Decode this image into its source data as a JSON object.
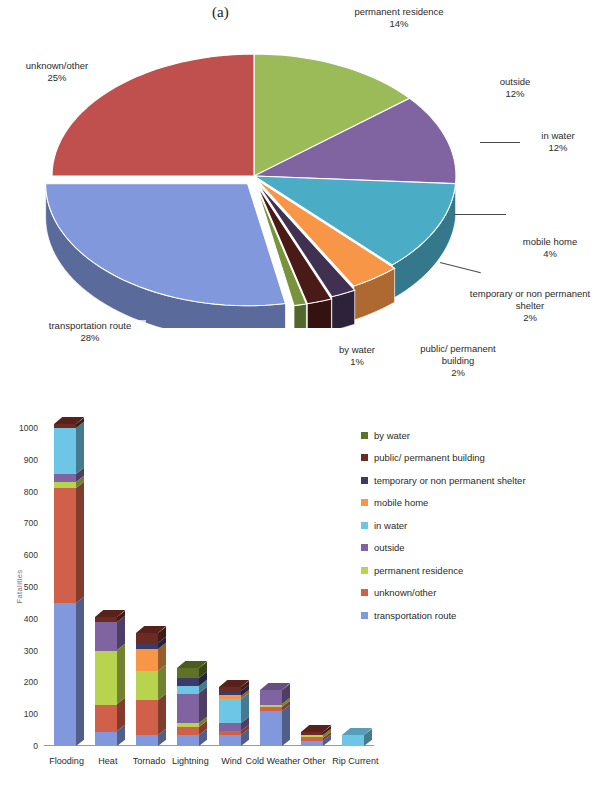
{
  "figure": {
    "panel_a_label": "(a)",
    "panel_b_label": "(b)"
  },
  "chart_data": [
    {
      "type": "pie",
      "title": "(a)",
      "labels": [
        "permanent residence",
        "outside",
        "in water",
        "mobile home",
        "temporary or non permanent shelter",
        "public/ permanent building",
        "by water",
        "transportation route",
        "unknown/other"
      ],
      "values": [
        14,
        12,
        12,
        4,
        2,
        2,
        1,
        28,
        25
      ],
      "value_suffix": "%",
      "colors": [
        "#9BBB59",
        "#8064A2",
        "#4BACC6",
        "#F79646",
        "#403152",
        "#4A1A17",
        "#77933C",
        "#8198DC",
        "#C0504D"
      ],
      "legend": "labels with leader lines around pie",
      "slices": [
        {
          "label": "permanent residence",
          "value": 14,
          "display": "14%",
          "color": "#9BBB59"
        },
        {
          "label": "outside",
          "value": 12,
          "display": "12%",
          "color": "#8064A2"
        },
        {
          "label": "in water",
          "value": 12,
          "display": "12%",
          "color": "#4BACC6"
        },
        {
          "label": "mobile home",
          "value": 4,
          "display": "4%",
          "color": "#F79646"
        },
        {
          "label": "temporary or non permanent shelter",
          "value": 2,
          "display": "2%",
          "color": "#403152"
        },
        {
          "label": "public/ permanent building",
          "value": 2,
          "display": "2%",
          "color": "#4A1A17"
        },
        {
          "label": "by water",
          "value": 1,
          "display": "1%",
          "color": "#77933C"
        },
        {
          "label": "transportation route",
          "value": 28,
          "display": "28%",
          "color": "#8198DC"
        },
        {
          "label": "unknown/other",
          "value": 25,
          "display": "25%",
          "color": "#C0504D"
        }
      ]
    },
    {
      "type": "bar",
      "stacked": true,
      "title": "(b)",
      "xlabel": "",
      "ylabel": "Fatalities",
      "ylim": [
        0,
        1000
      ],
      "yticks": [
        0,
        100,
        200,
        300,
        400,
        500,
        600,
        700,
        800,
        900,
        1000
      ],
      "grid": false,
      "legend_position": "right",
      "categories": [
        "Flooding",
        "Heat",
        "Tornado",
        "Lightning",
        "Wind",
        "Cold Weather",
        "Other",
        "Rip Current"
      ],
      "series": [
        {
          "name": "by water",
          "color": "#5E7326",
          "values": [
            0,
            0,
            0,
            30,
            0,
            0,
            0,
            0
          ]
        },
        {
          "name": "public/ permanent building",
          "color": "#6B2B22",
          "values": [
            12,
            15,
            30,
            0,
            12,
            0,
            10,
            0
          ]
        },
        {
          "name": "temporary or non permanent shelter",
          "color": "#3B3A68",
          "values": [
            0,
            0,
            20,
            25,
            15,
            0,
            0,
            0
          ]
        },
        {
          "name": "mobile home",
          "color": "#F79646",
          "values": [
            0,
            0,
            70,
            0,
            12,
            0,
            0,
            0
          ]
        },
        {
          "name": "in water",
          "color": "#6EC6E6",
          "values": [
            145,
            0,
            0,
            25,
            75,
            0,
            0,
            35
          ]
        },
        {
          "name": "outside",
          "color": "#8064A2",
          "values": [
            25,
            90,
            0,
            93,
            25,
            45,
            0,
            0
          ]
        },
        {
          "name": "permanent residence",
          "color": "#B8D44E",
          "values": [
            20,
            170,
            90,
            12,
            0,
            8,
            8,
            0
          ]
        },
        {
          "name": "unknown/other",
          "color": "#D0604A",
          "values": [
            360,
            85,
            110,
            25,
            12,
            12,
            10,
            0
          ]
        },
        {
          "name": "transportation route",
          "color": "#8198DC",
          "values": [
            450,
            45,
            35,
            35,
            35,
            110,
            17,
            0
          ]
        }
      ],
      "totals": [
        1012,
        405,
        355,
        245,
        186,
        175,
        45,
        35
      ]
    }
  ]
}
